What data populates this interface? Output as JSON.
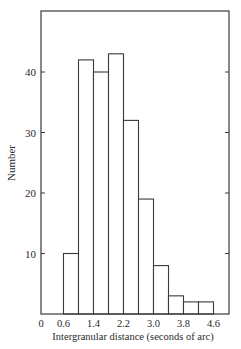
{
  "chart_data": {
    "type": "bar",
    "subtype": "histogram",
    "title": "",
    "xlabel": "Intergranular distance (seconds of arc)",
    "ylabel": "Number",
    "bin_edges": [
      0.6,
      1.0,
      1.4,
      1.8,
      2.2,
      2.6,
      3.0,
      3.4,
      3.8,
      4.2,
      4.6
    ],
    "categories": [
      "0.6-1.0",
      "1.0-1.4",
      "1.4-1.8",
      "1.8-2.2",
      "2.2-2.6",
      "2.6-3.0",
      "3.0-3.4",
      "3.4-3.8",
      "3.8-4.2",
      "4.2-4.6"
    ],
    "values": [
      10,
      42,
      40,
      43,
      32,
      19,
      8,
      3,
      2,
      2
    ],
    "xlim": [
      0,
      5.0
    ],
    "ylim": [
      0,
      50
    ],
    "x_ticks": [
      0,
      0.6,
      1.4,
      2.2,
      3.0,
      3.8,
      4.6
    ],
    "x_tick_labels": [
      "0",
      "0.6",
      "1.4",
      "2.2",
      "3.0",
      "3.8",
      "4.6"
    ],
    "y_ticks": [
      10,
      20,
      30,
      40
    ],
    "y_tick_labels": [
      "10",
      "20",
      "30",
      "40"
    ],
    "grid": false,
    "legend": null,
    "frame": "box"
  }
}
